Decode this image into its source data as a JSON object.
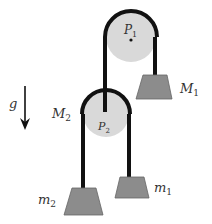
{
  "diagram": {
    "type": "double-pulley-system",
    "gravity": {
      "label": "g",
      "direction": "down"
    },
    "pulleys": [
      {
        "id": "P1",
        "label": "P",
        "sub": "1",
        "cx": 131,
        "cy": 37,
        "r": 26
      },
      {
        "id": "P2",
        "label": "P",
        "sub": "2",
        "cx": 106,
        "cy": 114,
        "r": 24
      }
    ],
    "masses": [
      {
        "id": "M1",
        "label": "M",
        "sub": "1"
      },
      {
        "id": "M2",
        "label": "M",
        "sub": "2"
      },
      {
        "id": "m1",
        "label": "m",
        "sub": "1"
      },
      {
        "id": "m2",
        "label": "m",
        "sub": "2"
      }
    ],
    "colors": {
      "pulley_fill": "#d9d9d9",
      "mass_fill": "#8c8c8c",
      "rope": "#111111",
      "text": "#333333"
    }
  }
}
